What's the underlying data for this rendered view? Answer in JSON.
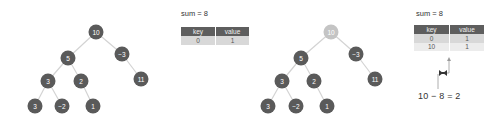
{
  "colors": {
    "node": "#5a5a5a",
    "node_highlight": "#c4c4c4",
    "edge": "#d3d3d3",
    "table_header": "#5e5e5e",
    "table_row_alt1": "#d8d8d8",
    "table_row_alt2": "#ececec"
  },
  "panel1": {
    "tree": {
      "nodes": [
        {
          "id": "n10",
          "label": "10",
          "x": 96,
          "y": 32,
          "highlight": false
        },
        {
          "id": "n5",
          "label": "5",
          "x": 68,
          "y": 58,
          "highlight": false
        },
        {
          "id": "nm3",
          "label": "−3",
          "x": 122,
          "y": 54,
          "highlight": false
        },
        {
          "id": "n3a",
          "label": "3",
          "x": 48,
          "y": 81,
          "highlight": false
        },
        {
          "id": "n2",
          "label": "2",
          "x": 81,
          "y": 81,
          "highlight": false
        },
        {
          "id": "n11",
          "label": "11",
          "x": 141,
          "y": 79,
          "highlight": false
        },
        {
          "id": "n3b",
          "label": "3",
          "x": 35,
          "y": 106,
          "highlight": false
        },
        {
          "id": "nm2",
          "label": "−2",
          "x": 62,
          "y": 106,
          "highlight": false
        },
        {
          "id": "n1",
          "label": "1",
          "x": 93,
          "y": 106,
          "highlight": false
        }
      ]
    },
    "sum_label": "sum = 8",
    "table": {
      "headers": [
        "key",
        "value"
      ],
      "rows": [
        [
          "0",
          "1"
        ]
      ]
    }
  },
  "panel2": {
    "tree": {
      "nodes": [
        {
          "id": "n10",
          "label": "10",
          "x": 331,
          "y": 32,
          "highlight": true
        },
        {
          "id": "n5",
          "label": "5",
          "x": 301,
          "y": 58,
          "highlight": false
        },
        {
          "id": "nm3",
          "label": "−3",
          "x": 356,
          "y": 54,
          "highlight": false
        },
        {
          "id": "n3a",
          "label": "3",
          "x": 282,
          "y": 81,
          "highlight": false
        },
        {
          "id": "n2",
          "label": "2",
          "x": 314,
          "y": 81,
          "highlight": false
        },
        {
          "id": "n11",
          "label": "11",
          "x": 375,
          "y": 79,
          "highlight": false
        },
        {
          "id": "n3b",
          "label": "3",
          "x": 268,
          "y": 106,
          "highlight": false
        },
        {
          "id": "nm2",
          "label": "−2",
          "x": 296,
          "y": 106,
          "highlight": false
        },
        {
          "id": "n1",
          "label": "1",
          "x": 327,
          "y": 106,
          "highlight": false
        }
      ]
    },
    "sum_label": "sum = 8",
    "table": {
      "headers": [
        "key",
        "value"
      ],
      "rows": [
        [
          "0",
          "1"
        ],
        [
          "10",
          "1"
        ]
      ]
    },
    "lookup_icon": "bowtie-icon",
    "formula": "10 − 8 = 2"
  },
  "edges": [
    [
      "n10",
      "n5"
    ],
    [
      "n10",
      "nm3"
    ],
    [
      "n5",
      "n3a"
    ],
    [
      "n5",
      "n2"
    ],
    [
      "nm3",
      "n11"
    ],
    [
      "n3a",
      "n3b"
    ],
    [
      "n3a",
      "nm2"
    ],
    [
      "n2",
      "n1"
    ]
  ]
}
